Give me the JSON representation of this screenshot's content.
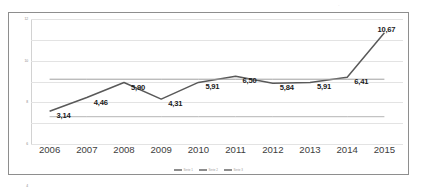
{
  "chart_data": {
    "type": "line",
    "title": "",
    "xlabel": "",
    "ylabel": "",
    "x": [
      "2006",
      "2007",
      "2008",
      "2009",
      "2010",
      "2011",
      "2012",
      "2013",
      "2014",
      "2015"
    ],
    "categories": [
      "2006",
      "2007",
      "2008",
      "2009",
      "2010",
      "2011",
      "2012",
      "2013",
      "2014",
      "2015"
    ],
    "ylim": [
      0,
      12
    ],
    "yticks": [
      "0",
      "2",
      "4",
      "6",
      "8",
      "10",
      "12"
    ],
    "ytick_values": [
      0,
      2,
      4,
      6,
      8,
      10,
      12
    ],
    "grid": true,
    "legend_position": "bottom-center",
    "decimal_separator": ",",
    "series": [
      {
        "name": "Serie 1",
        "values": [
          3.14,
          4.46,
          5.9,
          4.31,
          5.91,
          6.5,
          5.84,
          5.91,
          6.41,
          10.67
        ],
        "labels": [
          "3,14",
          "4,46",
          "5,90",
          "4,31",
          "5,91",
          "6,50",
          "5,84",
          "5,91",
          "6,41",
          "10,67"
        ],
        "color": "#595959",
        "show_labels": true
      },
      {
        "name": "Serie 2",
        "values": [
          6.22,
          6.22,
          6.22,
          6.22,
          6.22,
          6.22,
          6.22,
          6.22,
          6.22,
          6.22
        ],
        "labels": [],
        "color": "#a0a0a0",
        "show_labels": false
      },
      {
        "name": "Serie 3",
        "values": [
          2.62,
          2.62,
          2.62,
          2.62,
          2.62,
          2.62,
          2.62,
          2.62,
          2.62,
          2.62
        ],
        "labels": [],
        "color": "#b4b4b4",
        "show_labels": false
      }
    ],
    "legend": [
      {
        "label": "Serie 1",
        "color": "#8d8d8d"
      },
      {
        "label": "Serie 2",
        "color": "#8d8d8d"
      },
      {
        "label": "Serie 3",
        "color": "#8d8d8d"
      }
    ]
  },
  "artifacts": {
    "speckle_1": "·",
    "speckle_2": "·",
    "speckle_3": "·",
    "footer_bleed": ""
  }
}
